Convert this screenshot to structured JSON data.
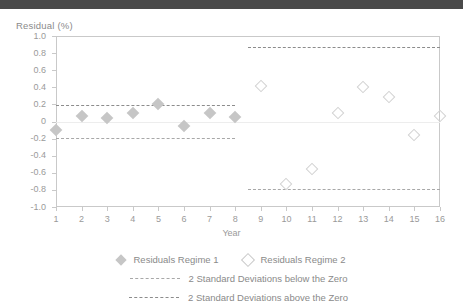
{
  "topbar": {
    "present": true,
    "color": "#4a4a4a"
  },
  "chart_data": {
    "type": "scatter",
    "title": "",
    "ylabel": "Residual (%)",
    "xlabel": "Year",
    "ylim": [
      -1.0,
      1.0
    ],
    "xlim": [
      1,
      16
    ],
    "grid": false,
    "legend_position": "bottom",
    "y_ticks": [
      "1.0",
      "0.8",
      "0.6",
      "0.4",
      "0.2",
      "0",
      "-0.2",
      "-0.4",
      "-0.6",
      "-0.8",
      "-1.0"
    ],
    "y_tick_values": [
      1.0,
      0.8,
      0.6,
      0.4,
      0.2,
      0,
      -0.2,
      -0.4,
      -0.6,
      -0.8,
      -1.0
    ],
    "x_ticks": [
      "1",
      "2",
      "3",
      "4",
      "5",
      "6",
      "7",
      "8",
      "9",
      "10",
      "11",
      "12",
      "13",
      "14",
      "15",
      "16"
    ],
    "x_tick_values": [
      1,
      2,
      3,
      4,
      5,
      6,
      7,
      8,
      9,
      10,
      11,
      12,
      13,
      14,
      15,
      16
    ],
    "series": [
      {
        "name": "Residuals Regime 1",
        "marker": "filled-diamond",
        "color": "#c6c6c6",
        "x": [
          1,
          2,
          3,
          4,
          5,
          6,
          7,
          8
        ],
        "values": [
          -0.1,
          0.07,
          0.04,
          0.1,
          0.21,
          -0.05,
          0.1,
          0.05
        ]
      },
      {
        "name": "Residuals Regime 2",
        "marker": "hollow-diamond",
        "color": "#d2d2d2",
        "x": [
          9,
          10,
          11,
          12,
          13,
          14,
          15,
          16
        ],
        "values": [
          0.42,
          -0.73,
          -0.55,
          0.1,
          0.4,
          0.29,
          -0.16,
          0.07
        ]
      }
    ],
    "bands": [
      {
        "name": "2 Standard Deviations above the Zero",
        "segment": "regime-1",
        "value": 0.19,
        "x_from": 1,
        "x_to": 8,
        "style": "long-dash",
        "color": "#8c8c8c"
      },
      {
        "name": "2 Standard Deviations below the Zero",
        "segment": "regime-1",
        "value": -0.19,
        "x_from": 1,
        "x_to": 8,
        "style": "short-dash",
        "color": "#a8a8a8"
      },
      {
        "name": "2 Standard Deviations above the Zero",
        "segment": "regime-2",
        "value": 0.87,
        "x_from": 8.5,
        "x_to": 16,
        "style": "long-dash",
        "color": "#8c8c8c"
      },
      {
        "name": "2 Standard Deviations below the Zero",
        "segment": "regime-2",
        "value": -0.79,
        "x_from": 8.5,
        "x_to": 16,
        "style": "short-dash",
        "color": "#a8a8a8"
      }
    ],
    "legend": [
      {
        "label": "Residuals Regime 1",
        "marker": "filled-diamond"
      },
      {
        "label": "Residuals Regime 2",
        "marker": "hollow-diamond"
      },
      {
        "label": "2 Standard Deviations below the Zero",
        "marker": "short-dash-line"
      },
      {
        "label": "2 Standard Deviations above the Zero",
        "marker": "long-dash-line"
      }
    ]
  }
}
